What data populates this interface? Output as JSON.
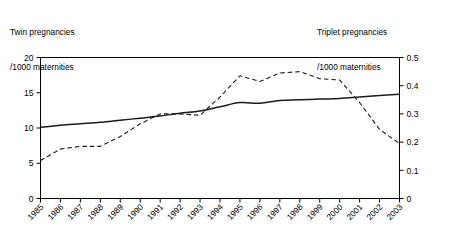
{
  "captions": {
    "left_line1": "Twin pregnancies",
    "left_line2": "/1000 maternities",
    "right_line1": "Triplet pregnancies",
    "right_line2": "/1000 maternities"
  },
  "colors": {
    "axis": "#000000",
    "twin_series": "#1a1a1a",
    "triplet_series": "#1a1a1a",
    "background": "#ffffff"
  },
  "chart_data": {
    "type": "line",
    "title": "",
    "xlabel": "",
    "grid": false,
    "legend": "none",
    "x": [
      "1985",
      "1986",
      "1987",
      "1988",
      "1989",
      "1990",
      "1991",
      "1992",
      "1993",
      "1994",
      "1995",
      "1996",
      "1997",
      "1998",
      "1999",
      "2000",
      "2001",
      "2002",
      "2003"
    ],
    "axes": {
      "left": {
        "label_line1": "Twin pregnancies",
        "label_line2": "/1000 maternities",
        "ticks": [
          0,
          5,
          10,
          15,
          20
        ],
        "tick_labels": [
          "0",
          "5",
          "10",
          "15",
          "20"
        ],
        "ylim": [
          0,
          20
        ]
      },
      "right": {
        "label_line1": "Triplet pregnancies",
        "label_line2": "/1000 maternities",
        "ticks": [
          0,
          0.1,
          0.2,
          0.3,
          0.4,
          0.5
        ],
        "tick_labels": [
          "0",
          "0.1",
          "0.2",
          "0.3",
          "0.4",
          "0.5"
        ],
        "ylim": [
          0,
          0.5
        ]
      }
    },
    "series": [
      {
        "name": "Twin pregnancies /1000 maternities",
        "axis": "left",
        "style": "solid",
        "values": [
          10.1,
          10.4,
          10.6,
          10.8,
          11.1,
          11.4,
          11.7,
          12.1,
          12.4,
          13.0,
          13.6,
          13.5,
          13.9,
          14.0,
          14.1,
          14.2,
          14.4,
          14.6,
          14.8
        ]
      },
      {
        "name": "Triplet pregnancies /1000 maternities",
        "axis": "right",
        "style": "dashed",
        "values": [
          0.135,
          0.175,
          0.185,
          0.185,
          0.22,
          0.265,
          0.3,
          0.3,
          0.295,
          0.36,
          0.435,
          0.415,
          0.445,
          0.45,
          0.425,
          0.42,
          0.34,
          0.245,
          0.195
        ]
      }
    ]
  }
}
